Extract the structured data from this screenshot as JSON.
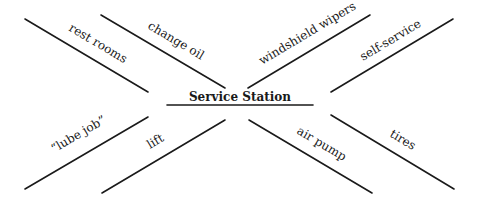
{
  "diagram": {
    "type": "spider-map",
    "center": {
      "label": "Service Station"
    },
    "legs": [
      {
        "label": "rest rooms",
        "position": "upper-left-outer"
      },
      {
        "label": "change oil",
        "position": "upper-left-inner"
      },
      {
        "label": "windshield wipers",
        "position": "upper-right-inner"
      },
      {
        "label": "self-service",
        "position": "upper-right-outer"
      },
      {
        "label": "“lube job”",
        "position": "lower-left-outer"
      },
      {
        "label": "lift",
        "position": "lower-left-inner"
      },
      {
        "label": "air pump",
        "position": "lower-right-inner"
      },
      {
        "label": "tires",
        "position": "lower-right-outer"
      }
    ]
  }
}
